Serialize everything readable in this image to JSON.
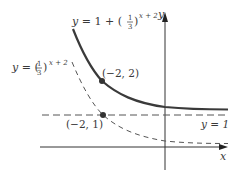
{
  "figure": {
    "curve_solid": {
      "label_prefix": "y = 1 + ",
      "frac_num": "1",
      "frac_den": "3",
      "exponent": "x + 2",
      "style": "solid",
      "color": "#3a3a3a"
    },
    "curve_dashed": {
      "label_prefix": "y = ",
      "frac_num": "1",
      "frac_den": "3",
      "exponent": "x + 2",
      "style": "dashed",
      "color": "#555555"
    },
    "asymptote": {
      "label": "y = 1",
      "style": "dashed"
    },
    "points": [
      {
        "label": "(−2, 2)",
        "x": -2,
        "y": 2
      },
      {
        "label": "(−2, 1)",
        "x": -2,
        "y": 1
      }
    ],
    "axes": {
      "x_label": "x",
      "y_label": "y"
    }
  }
}
